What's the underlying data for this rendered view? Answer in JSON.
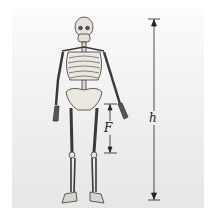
{
  "figure": {
    "labels": {
      "height": "h",
      "femur": "F"
    },
    "colors": {
      "background": "#ececec",
      "bone": "#e4e0d8",
      "outline": "#333333",
      "dimension_line": "#222222"
    }
  }
}
